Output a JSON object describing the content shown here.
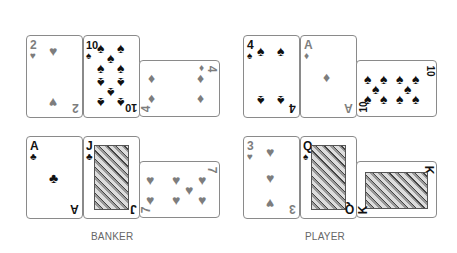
{
  "banker": {
    "label": "BANKER",
    "row1": [
      {
        "rank": "2",
        "suit": "♥",
        "color": "red"
      },
      {
        "rank": "10",
        "suit": "♠",
        "color": "black"
      },
      {
        "rank": "4",
        "suit": "♦",
        "color": "red",
        "rotated": true
      }
    ],
    "row2": [
      {
        "rank": "A",
        "suit": "♣",
        "color": "black"
      },
      {
        "rank": "J",
        "suit": "♣",
        "color": "black"
      },
      {
        "rank": "7",
        "suit": "♥",
        "color": "red",
        "rotated": true
      }
    ]
  },
  "player": {
    "label": "PLAYER",
    "row1": [
      {
        "rank": "4",
        "suit": "♠",
        "color": "black"
      },
      {
        "rank": "A",
        "suit": "♦",
        "color": "red"
      },
      {
        "rank": "10",
        "suit": "♠",
        "color": "black",
        "rotated": true
      }
    ],
    "row2": [
      {
        "rank": "3",
        "suit": "♥",
        "color": "red"
      },
      {
        "rank": "Q",
        "suit": "♠",
        "color": "black"
      },
      {
        "rank": "K",
        "suit": "♠",
        "color": "black",
        "rotated": true
      }
    ]
  }
}
